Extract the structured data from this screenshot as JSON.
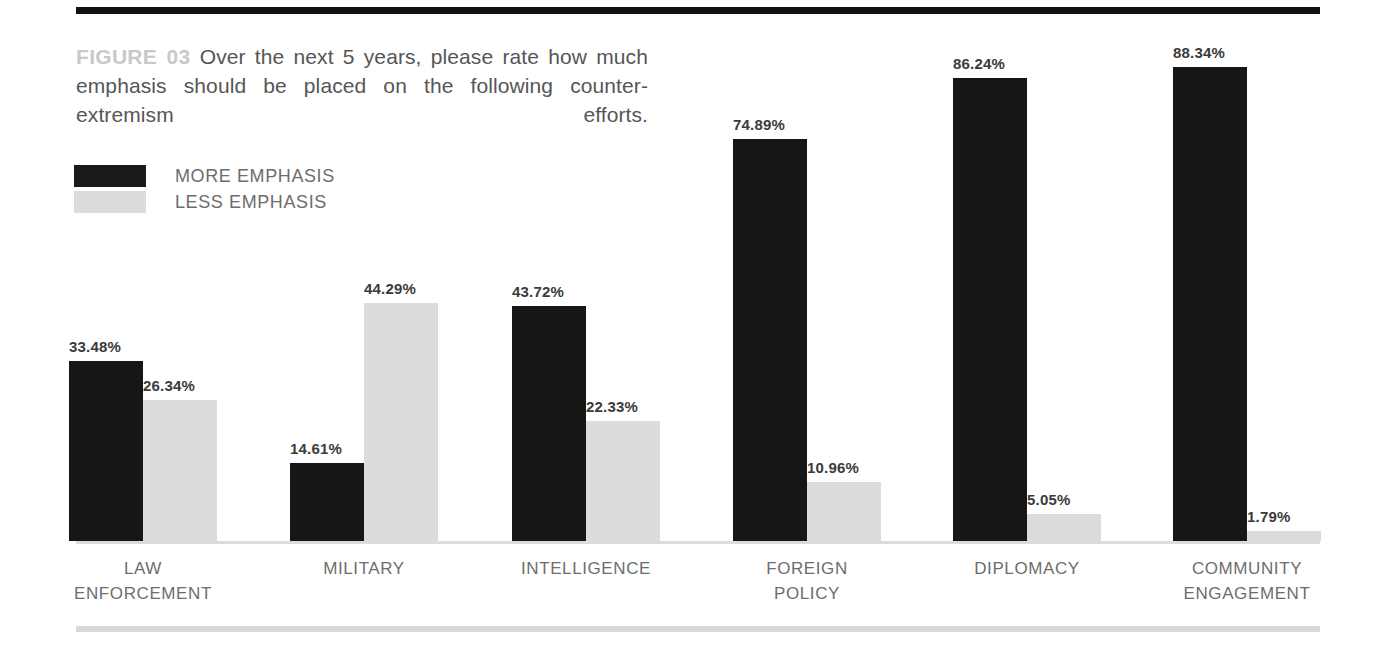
{
  "figure": {
    "prefix": "FIGURE 03",
    "caption": "Over the next 5 years, please rate how much emphasis should be placed on the following counter-extremism efforts."
  },
  "legend": {
    "items": [
      {
        "label": "MORE EMPHASIS",
        "color": "#161616",
        "key": "more"
      },
      {
        "label": "LESS EMPHASIS",
        "color": "#dcdcdc",
        "key": "less"
      }
    ]
  },
  "colors": {
    "more_emphasis": "#161616",
    "less_emphasis": "#dcdcdc",
    "top_rule": "#111111",
    "bottom_rule": "#d8d8d8",
    "axis_line": "#dcdcdc",
    "caption_text": "#565656",
    "caption_prefix": "#c9c9c9",
    "value_label": "#3b3b3b",
    "category_label": "#6d6d6d"
  },
  "chart_data": {
    "type": "bar",
    "title": "FIGURE 03 Over the next 5 years, please rate how much emphasis should be placed on the following counter-extremism efforts.",
    "xlabel": "",
    "ylabel": "",
    "ylim": [
      0,
      100
    ],
    "grid": false,
    "legend_position": "top-left",
    "categories": [
      "LAW ENFORCEMENT",
      "MILITARY",
      "INTELLIGENCE",
      "FOREIGN POLICY",
      "DIPLOMACY",
      "COMMUNITY ENGAGEMENT"
    ],
    "category_lines": [
      [
        "LAW",
        "ENFORCEMENT"
      ],
      [
        "MILITARY",
        ""
      ],
      [
        "INTELLIGENCE",
        ""
      ],
      [
        "FOREIGN",
        "POLICY"
      ],
      [
        "DIPLOMACY",
        ""
      ],
      [
        "COMMUNITY",
        "ENGAGEMENT"
      ]
    ],
    "series": [
      {
        "name": "MORE EMPHASIS",
        "color": "#161616",
        "values": [
          33.48,
          14.61,
          43.72,
          74.89,
          86.24,
          88.34
        ],
        "labels": [
          "33.48%",
          "14.61%",
          "43.72%",
          "74.89%",
          "86.24%",
          "88.34%"
        ]
      },
      {
        "name": "LESS EMPHASIS",
        "color": "#dcdcdc",
        "values": [
          26.34,
          44.29,
          22.33,
          10.96,
          5.05,
          1.79
        ],
        "labels": [
          "26.34%",
          "44.29%",
          "22.33%",
          "10.96%",
          "5.05%",
          "1.79%"
        ]
      }
    ]
  }
}
